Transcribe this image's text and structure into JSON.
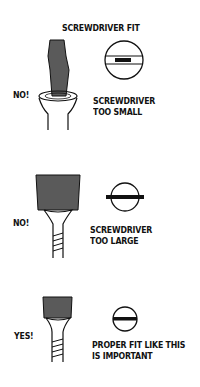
{
  "title": "SCREWDRIVER FIT",
  "colors": {
    "blade": "#5a5a5a",
    "ink": "#111111",
    "background": "#ffffff"
  },
  "panels": [
    {
      "verdict": "NO!",
      "caption_line1": "SCREWDRIVER",
      "caption_line2": "TOO SMALL",
      "illustration": "narrow-blade-in-wide-slot"
    },
    {
      "verdict": "NO!",
      "caption_line1": "SCREWDRIVER",
      "caption_line2": "TOO LARGE",
      "illustration": "wide-blade-overhanging-slot"
    },
    {
      "verdict": "YES!",
      "caption_line1": "PROPER FIT LIKE THIS",
      "caption_line2": "IS IMPORTANT",
      "illustration": "blade-matching-slot"
    }
  ]
}
